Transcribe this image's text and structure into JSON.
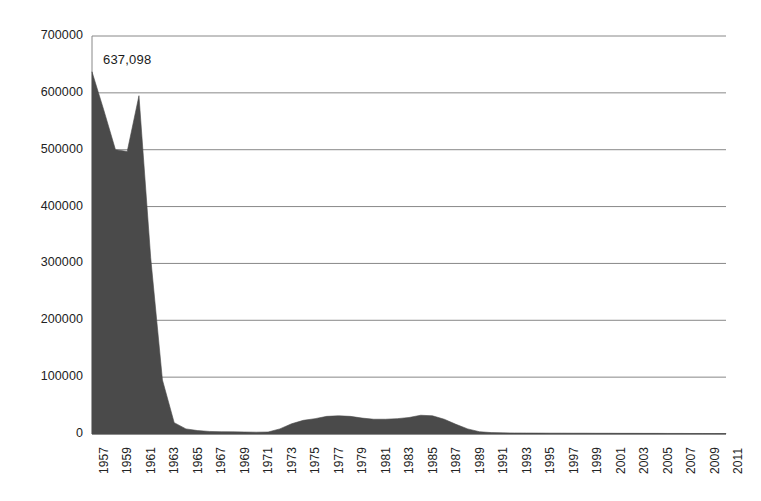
{
  "chart_data": {
    "type": "area",
    "title": "",
    "subtitle": "",
    "xlabel": "",
    "ylabel": "",
    "grid": true,
    "legend": false,
    "legend_position": "none",
    "series_color": "#4a4a4a",
    "axis_color": "#888888",
    "xlim": [
      1957,
      2011
    ],
    "ylim": [
      0,
      700000
    ],
    "yticks": [
      0,
      100000,
      200000,
      300000,
      400000,
      500000,
      600000,
      700000
    ],
    "ytick_labels": [
      "0",
      "100000",
      "200000",
      "300000",
      "400000",
      "500000",
      "600000",
      "700000"
    ],
    "xticks": [
      1957,
      1959,
      1961,
      1963,
      1965,
      1967,
      1969,
      1971,
      1973,
      1975,
      1977,
      1979,
      1981,
      1983,
      1985,
      1987,
      1989,
      1991,
      1993,
      1995,
      1997,
      1999,
      2001,
      2003,
      2005,
      2007,
      2009,
      2011
    ],
    "xtick_labels": [
      "1957",
      "1959",
      "1961",
      "1963",
      "1965",
      "1967",
      "1969",
      "1971",
      "1973",
      "1975",
      "1977",
      "1979",
      "1981",
      "1983",
      "1985",
      "1987",
      "1989",
      "1991",
      "1993",
      "1995",
      "1997",
      "1999",
      "2001",
      "2003",
      "2005",
      "2007",
      "2009",
      "2011"
    ],
    "annotations": [
      {
        "text": "637,098",
        "x": 1957,
        "y": 637098
      }
    ],
    "x": [
      1957,
      1958,
      1959,
      1960,
      1961,
      1962,
      1963,
      1964,
      1965,
      1966,
      1967,
      1968,
      1969,
      1970,
      1971,
      1972,
      1973,
      1974,
      1975,
      1976,
      1977,
      1978,
      1979,
      1980,
      1981,
      1982,
      1983,
      1984,
      1985,
      1986,
      1987,
      1988,
      1989,
      1990,
      1991,
      1992,
      1993,
      1994,
      1995,
      1996,
      1997,
      1998,
      1999,
      2000,
      2001,
      2002,
      2003,
      2004,
      2005,
      2006,
      2007,
      2008,
      2009,
      2010,
      2011
    ],
    "values": [
      637098,
      570000,
      500000,
      497000,
      595000,
      310000,
      95000,
      20000,
      9000,
      6000,
      4500,
      4000,
      3800,
      3500,
      3200,
      3500,
      9000,
      18000,
      24000,
      27000,
      31000,
      32000,
      31000,
      28000,
      26000,
      26000,
      27000,
      29000,
      33000,
      32000,
      26000,
      17000,
      9000,
      4000,
      2500,
      2000,
      1800,
      1700,
      1600,
      1500,
      1500,
      1400,
      1400,
      1300,
      1300,
      1200,
      1200,
      1100,
      1100,
      1000,
      1000,
      900,
      900,
      800,
      800
    ]
  }
}
